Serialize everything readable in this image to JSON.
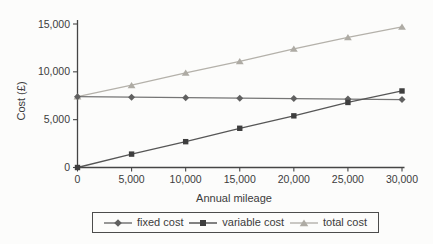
{
  "chart_data": {
    "type": "line",
    "title": "",
    "xlabel": "Annual mileage",
    "ylabel": "Cost (£)",
    "x": [
      0,
      5000,
      10000,
      15000,
      20000,
      25000,
      30000
    ],
    "x_tick_labels": [
      "0",
      "5,000",
      "10,000",
      "15,000",
      "20,000",
      "25,000",
      "30,000"
    ],
    "y_tick_values": [
      0,
      5000,
      10000,
      15000
    ],
    "y_tick_labels": [
      "0",
      "5,000",
      "10,000",
      "15,000"
    ],
    "xlim": [
      0,
      30000
    ],
    "ylim": [
      0,
      15000
    ],
    "grid": false,
    "legend_position": "bottom",
    "series": [
      {
        "name": "fixed cost",
        "marker": "diamond",
        "line_color": "#757575",
        "marker_color": "#606060",
        "values": [
          7400,
          7350,
          7300,
          7250,
          7200,
          7150,
          7100
        ]
      },
      {
        "name": "variable cost",
        "marker": "square",
        "line_color": "#565656",
        "marker_color": "#3e3e3e",
        "values": [
          0,
          1400,
          2700,
          4100,
          5400,
          6800,
          8000
        ]
      },
      {
        "name": "total cost",
        "marker": "triangle",
        "line_color": "#b4b1aa",
        "marker_color": "#aeaba4",
        "values": [
          7400,
          8600,
          9900,
          11100,
          12400,
          13600,
          14700
        ]
      }
    ],
    "colors": {
      "axis": "#454545",
      "text": "#3b3b3b",
      "legend_border": "#4c4c4c",
      "background": "#fcfcfb"
    }
  }
}
